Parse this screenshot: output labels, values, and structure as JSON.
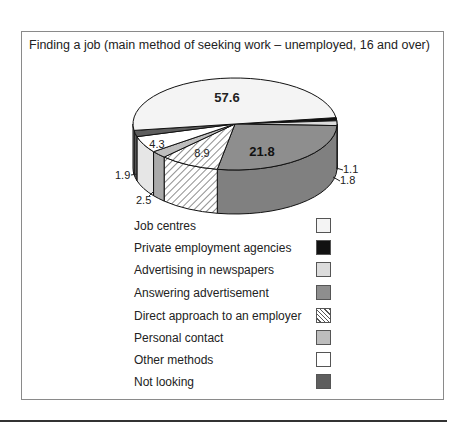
{
  "chart_data": {
    "type": "pie",
    "title": "Finding a job (main method of seeking work – unemployed, 16 and over)",
    "categories": [
      "Job centres",
      "Private employment agencies",
      "Advertising in newspapers",
      "Answering advertisement",
      "Direct approach to an employer",
      "Personal contact",
      "Other methods",
      "Not looking"
    ],
    "values": [
      57.6,
      1.1,
      1.8,
      21.8,
      8.9,
      2.5,
      4.3,
      1.9
    ],
    "colors": [
      "#f4f4f4",
      "#111111",
      "#dcdcdc",
      "#8e8e8e",
      "hatch",
      "#bdbdbd",
      "#ffffff",
      "#5e5e5e"
    ],
    "style": "3d-pie",
    "legend_position": "below"
  },
  "title": "Finding a job (main method of seeking work – unemployed, 16 and over)",
  "legend": [
    {
      "label": "Job centres",
      "swatch": "#f4f4f4"
    },
    {
      "label": "Private employment agencies",
      "swatch": "#111111"
    },
    {
      "label": "Advertising in newspapers",
      "swatch": "#dcdcdc"
    },
    {
      "label": "Answering advertisement",
      "swatch": "#8e8e8e"
    },
    {
      "label": "Direct approach to an employer",
      "swatch": "hatch"
    },
    {
      "label": "Personal contact",
      "swatch": "#bdbdbd"
    },
    {
      "label": "Other methods",
      "swatch": "#ffffff"
    },
    {
      "label": "Not looking",
      "swatch": "#5e5e5e"
    }
  ],
  "labels": {
    "job_centres": "57.6",
    "private": "1.1",
    "newspapers": "1.8",
    "answering": "21.8",
    "direct": "8.9",
    "personal": "2.5",
    "other": "4.3",
    "not_looking": "1.9"
  }
}
